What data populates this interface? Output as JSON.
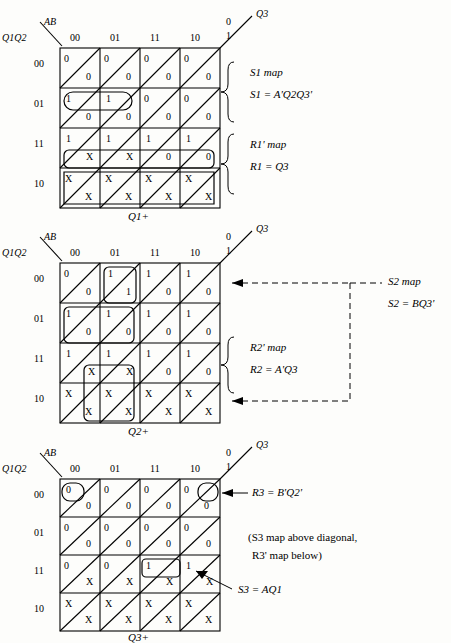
{
  "maps": [
    {
      "id": "map1",
      "top_var_label": "AB",
      "side_var_label": "Q1Q2",
      "right_var_label": "Q3",
      "col_headers": [
        "00",
        "01",
        "11",
        "10"
      ],
      "row_headers": [
        "00",
        "01",
        "11",
        "10"
      ],
      "diag_labels": [
        "0",
        "1"
      ],
      "bottom_label": "Q1+",
      "cells": [
        [
          {
            "u": "0",
            "l": "0"
          },
          {
            "u": "0",
            "l": "0"
          },
          {
            "u": "0",
            "l": "0"
          },
          {
            "u": "0",
            "l": "0"
          }
        ],
        [
          {
            "u": "1",
            "l": "0"
          },
          {
            "u": "1",
            "l": "0"
          },
          {
            "u": "0",
            "l": "0"
          },
          {
            "u": "0",
            "l": "0"
          }
        ],
        [
          {
            "u": "1",
            "l": "X"
          },
          {
            "u": "1",
            "l": "X"
          },
          {
            "u": "1",
            "l": "0"
          },
          {
            "u": "1",
            "l": "0"
          }
        ],
        [
          {
            "u": "X",
            "l": "X"
          },
          {
            "u": "X",
            "l": "X"
          },
          {
            "u": "X",
            "l": "X"
          },
          {
            "u": "X",
            "l": "X"
          }
        ]
      ],
      "annotations": [
        {
          "text": "S1 map",
          "kind": "brace-label"
        },
        {
          "text": "S1 = A'Q2Q3'",
          "kind": "equation"
        },
        {
          "text": "R1' map",
          "kind": "brace-label"
        },
        {
          "text": "R1 = Q3",
          "kind": "equation"
        }
      ]
    },
    {
      "id": "map2",
      "top_var_label": "AB",
      "side_var_label": "Q1Q2",
      "right_var_label": "Q3",
      "col_headers": [
        "00",
        "01",
        "11",
        "10"
      ],
      "row_headers": [
        "00",
        "01",
        "11",
        "10"
      ],
      "diag_labels": [
        "0",
        "1"
      ],
      "bottom_label": "Q2+",
      "cells": [
        [
          {
            "u": "0",
            "l": "0"
          },
          {
            "u": "1",
            "l": "1"
          },
          {
            "u": "1",
            "l": "0"
          },
          {
            "u": "1",
            "l": "0"
          }
        ],
        [
          {
            "u": "1",
            "l": "0"
          },
          {
            "u": "1",
            "l": "0"
          },
          {
            "u": "1",
            "l": "0"
          },
          {
            "u": "1",
            "l": "0"
          }
        ],
        [
          {
            "u": "1",
            "l": "X"
          },
          {
            "u": "1",
            "l": "X"
          },
          {
            "u": "1",
            "l": "0"
          },
          {
            "u": "1",
            "l": "0"
          }
        ],
        [
          {
            "u": "X",
            "l": "X"
          },
          {
            "u": "X",
            "l": "X"
          },
          {
            "u": "X",
            "l": "X"
          },
          {
            "u": "X",
            "l": "X"
          }
        ]
      ],
      "annotations": [
        {
          "text": "R2' map",
          "kind": "brace-label"
        },
        {
          "text": "R2 = A'Q3",
          "kind": "equation"
        },
        {
          "text": "S2 map",
          "kind": "far-label"
        },
        {
          "text": "S2 = BQ3'",
          "kind": "equation"
        }
      ]
    },
    {
      "id": "map3",
      "top_var_label": "AB",
      "side_var_label": "Q1Q2",
      "right_var_label": "Q3",
      "col_headers": [
        "00",
        "01",
        "11",
        "10"
      ],
      "row_headers": [
        "00",
        "01",
        "11",
        "10"
      ],
      "diag_labels": [
        "0",
        "1"
      ],
      "bottom_label": "Q3+",
      "cells": [
        [
          {
            "u": "0",
            "l": "0"
          },
          {
            "u": "0",
            "l": "0"
          },
          {
            "u": "0",
            "l": "0"
          },
          {
            "u": "0",
            "l": "0"
          }
        ],
        [
          {
            "u": "0",
            "l": "0"
          },
          {
            "u": "0",
            "l": "0"
          },
          {
            "u": "0",
            "l": "0"
          },
          {
            "u": "0",
            "l": "0"
          }
        ],
        [
          {
            "u": "0",
            "l": "X"
          },
          {
            "u": "0",
            "l": "X"
          },
          {
            "u": "1",
            "l": "X"
          },
          {
            "u": "1",
            "l": "X"
          }
        ],
        [
          {
            "u": "X",
            "l": "X"
          },
          {
            "u": "X",
            "l": "X"
          },
          {
            "u": "X",
            "l": "X"
          },
          {
            "u": "X",
            "l": "X"
          }
        ]
      ],
      "annotations": [
        {
          "text": "R3 = B'Q2'",
          "kind": "equation"
        },
        {
          "text": "(S3 map above diagonal,",
          "kind": "note"
        },
        {
          "text": "R3' map below)",
          "kind": "note"
        },
        {
          "text": "S3 = AQ1",
          "kind": "equation"
        }
      ]
    }
  ]
}
